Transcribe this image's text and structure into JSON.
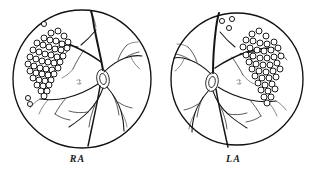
{
  "figure": {
    "kind": "retinal-fundus-line-drawing-pair",
    "background_color": "#ffffff",
    "ink_color": "#111111",
    "panels": [
      {
        "id": "right-eye",
        "label": "RA",
        "label_meaning": "right eye fundus",
        "limbus": {
          "cx": 82,
          "cy": 79,
          "r": 69
        },
        "optic_disc": {
          "cx": 103,
          "cy": 79,
          "rx": 6.5,
          "ry": 9.5,
          "rotate": -8
        },
        "macula": {
          "cx": 79,
          "cy": 82,
          "r": 3.4
        },
        "scar_cluster_count": 46,
        "scar_outlier_count": 2,
        "scar_radius": 3.0,
        "scar_region": "superior-nasal quadrant"
      },
      {
        "id": "left-eye",
        "label": "LA",
        "label_meaning": "left eye fundus",
        "limbus": {
          "cx": 81,
          "cy": 79,
          "r": 66
        },
        "optic_disc": {
          "cx": 56,
          "cy": 82,
          "rx": 6.5,
          "ry": 9.5,
          "rotate": 8
        },
        "macula": {
          "cx": 83,
          "cy": 82,
          "r": 3.4
        },
        "scar_cluster_count": 44,
        "scar_outlier_count": 3,
        "scar_radius": 3.0,
        "scar_region": "superior-temporal quadrant"
      }
    ]
  },
  "geometry": {
    "right_eye": {
      "limbus": {
        "cx": 82,
        "cy": 79,
        "r": 69
      },
      "disc": {
        "cx": 103,
        "cy": 79,
        "rx": 6.2,
        "ry": 9.6,
        "rot": -10
      },
      "macula_marks": [
        "M -2.5 -1.5 q 2 -1.6 4.2 0.2",
        "M -2.0 1.4 q 2.2 1.6 4.4 -0.3",
        "M 0.6 -2.6 l 0.3 5.0"
      ],
      "vessels": [
        {
          "w": "vessel-xl",
          "d": "M 103 70 C 101 58, 97 42, 94 26 C 93 19, 92 14, 91 11"
        },
        {
          "w": "vessel-lg",
          "d": "M 101 62 C 93 56, 82 50, 71 45 C 63 42, 55 40, 47 39"
        },
        {
          "w": "vessel-md",
          "d": "M 78 47 C 70 45, 62 45, 54 47"
        },
        {
          "w": "vessel-sm",
          "d": "M 71 45 C 68 51, 64 56, 59 60"
        },
        {
          "w": "vessel-sm",
          "d": "M 84 50 C 80 56, 76 62, 73 69"
        },
        {
          "w": "vessel-xs",
          "d": "M 73 69 C 70 73, 66 76, 62 78"
        },
        {
          "w": "vessel-md",
          "d": "M 104 72 C 110 66, 117 61, 125 58 C 131 56, 137 55, 142 56"
        },
        {
          "w": "vessel-sm",
          "d": "M 118 60 C 120 54, 123 49, 127 45"
        },
        {
          "w": "vessel-sm",
          "d": "M 125 58 C 129 55, 134 53, 139 52"
        },
        {
          "w": "vessel-xs",
          "d": "M 127 45 C 130 43, 134 42, 138 42"
        },
        {
          "w": "vessel-xs",
          "d": "M 131 57 C 133 62, 136 66, 140 69"
        },
        {
          "w": "vessel-md",
          "d": "M 103 88 C 100 97, 95 105, 88 112 C 82 118, 75 123, 69 127"
        },
        {
          "w": "vessel-sm",
          "d": "M 95 105 C 92 112, 90 119, 89 127"
        },
        {
          "w": "vessel-sm",
          "d": "M 88 112 C 82 113, 75 113, 69 111"
        },
        {
          "w": "vessel-lg",
          "d": "M 100 86 C 98 99, 95 113, 92 127 C 90 136, 89 142, 88 146"
        },
        {
          "w": "vessel-md",
          "d": "M 107 87 C 113 94, 118 102, 121 111 C 123 118, 124 125, 124 131"
        },
        {
          "w": "vessel-sm",
          "d": "M 113 95 C 116 101, 118 108, 119 115"
        },
        {
          "w": "vessel-sm",
          "d": "M 118 102 C 122 105, 127 107, 132 108"
        },
        {
          "w": "vessel-xs",
          "d": "M 121 111 C 124 116, 126 121, 127 127"
        },
        {
          "w": "vessel-md",
          "d": "M 98 84 C 89 90, 78 95, 66 98 C 57 100, 48 100, 40 99"
        },
        {
          "w": "vessel-sm",
          "d": "M 66 98 C 62 103, 58 108, 55 114"
        },
        {
          "w": "vessel-sm",
          "d": "M 55 114 C 59 117, 64 119, 70 120"
        },
        {
          "w": "vessel-xs",
          "d": "M 48 100 C 44 104, 41 109, 39 114"
        },
        {
          "w": "vessel-xs",
          "d": "M 40 99 C 36 101, 33 104, 30 108"
        },
        {
          "w": "vessel-sm",
          "d": "M 47 39 C 42 42, 37 46, 33 51"
        },
        {
          "w": "vessel-xs",
          "d": "M 54 47 C 51 52, 49 58, 48 64"
        },
        {
          "w": "vessel-md",
          "d": "M 96 30 C 91 36, 86 41, 81 45"
        },
        {
          "w": "vessel-xs",
          "d": "M 91 11 C 93 16, 95 21, 96 27"
        }
      ],
      "scars": [
        [
          51,
          33
        ],
        [
          58,
          31
        ],
        [
          64,
          36
        ],
        [
          44,
          38
        ],
        [
          50,
          40
        ],
        [
          56,
          41
        ],
        [
          62,
          44
        ],
        [
          68,
          42
        ],
        [
          37,
          43
        ],
        [
          43,
          45
        ],
        [
          49,
          47
        ],
        [
          55,
          49
        ],
        [
          61,
          50
        ],
        [
          67,
          48
        ],
        [
          33,
          50
        ],
        [
          39,
          52
        ],
        [
          45,
          54
        ],
        [
          51,
          55
        ],
        [
          57,
          57
        ],
        [
          63,
          56
        ],
        [
          30,
          57
        ],
        [
          36,
          59
        ],
        [
          42,
          61
        ],
        [
          48,
          62
        ],
        [
          54,
          63
        ],
        [
          60,
          62
        ],
        [
          28,
          64
        ],
        [
          34,
          66
        ],
        [
          40,
          68
        ],
        [
          46,
          69
        ],
        [
          52,
          70
        ],
        [
          58,
          68
        ],
        [
          30,
          71
        ],
        [
          36,
          73
        ],
        [
          42,
          74
        ],
        [
          48,
          75
        ],
        [
          54,
          74
        ],
        [
          33,
          78
        ],
        [
          39,
          80
        ],
        [
          45,
          81
        ],
        [
          51,
          80
        ],
        [
          37,
          85
        ],
        [
          43,
          86
        ],
        [
          49,
          85
        ],
        [
          41,
          91
        ],
        [
          47,
          91
        ],
        [
          44,
          96
        ]
      ],
      "scar_outliers": [
        [
          44,
          24
        ],
        [
          28,
          98
        ],
        [
          30,
          104
        ]
      ]
    },
    "left_eye": {
      "limbus": {
        "cx": 81,
        "cy": 79,
        "r": 66
      },
      "disc": {
        "cx": 56,
        "cy": 82,
        "rx": 6.2,
        "ry": 9.6,
        "rot": 10
      },
      "macula_marks": [
        "M -2.5 -1.5 q 2 -1.6 4.2 0.2",
        "M -2.0 1.4 q 2.2 1.6 4.4 -0.3",
        "M 0.6 -2.6 l 0.3 5.0"
      ],
      "vessels": [
        {
          "w": "vessel-xl",
          "d": "M 57 73 C 57 60, 58 44, 60 28 C 61 21, 62 16, 63 13"
        },
        {
          "w": "vessel-lg",
          "d": "M 59 68 C 68 62, 79 56, 91 52 C 100 49, 109 48, 117 48"
        },
        {
          "w": "vessel-md",
          "d": "M 84 54 C 93 52, 101 51, 109 52"
        },
        {
          "w": "vessel-sm",
          "d": "M 91 52 C 94 58, 97 63, 101 67"
        },
        {
          "w": "vessel-sm",
          "d": "M 76 57 C 80 63, 84 69, 87 75"
        },
        {
          "w": "vessel-xs",
          "d": "M 87 75 C 90 79, 94 82, 98 84"
        },
        {
          "w": "vessel-md",
          "d": "M 55 74 C 49 68, 42 63, 34 60 C 28 58, 22 57, 18 58"
        },
        {
          "w": "vessel-sm",
          "d": "M 41 62 C 39 56, 36 51, 32 47"
        },
        {
          "w": "vessel-sm",
          "d": "M 34 60 C 30 57, 25 55, 20 54"
        },
        {
          "w": "vessel-xs",
          "d": "M 32 47 C 29 45, 25 44, 21 44"
        },
        {
          "w": "vessel-xs",
          "d": "M 28 59 C 26 64, 23 68, 19 71"
        },
        {
          "w": "vessel-md",
          "d": "M 57 91 C 60 100, 65 108, 72 114 C 78 120, 85 124, 91 128"
        },
        {
          "w": "vessel-sm",
          "d": "M 65 108 C 68 114, 70 121, 71 129"
        },
        {
          "w": "vessel-sm",
          "d": "M 72 114 C 78 115, 85 115, 91 113"
        },
        {
          "w": "vessel-lg",
          "d": "M 60 89 C 62 102, 65 115, 68 129 C 70 138, 71 143, 72 147"
        },
        {
          "w": "vessel-md",
          "d": "M 53 90 C 47 97, 42 104, 39 113 C 37 120, 36 126, 36 132"
        },
        {
          "w": "vessel-sm",
          "d": "M 47 97 C 44 103, 42 110, 41 117"
        },
        {
          "w": "vessel-sm",
          "d": "M 42 104 C 38 107, 33 109, 28 110"
        },
        {
          "w": "vessel-xs",
          "d": "M 39 113 C 36 118, 34 123, 33 129"
        },
        {
          "w": "vessel-md",
          "d": "M 62 87 C 71 93, 82 97, 94 100 C 103 102, 112 102, 120 101"
        },
        {
          "w": "vessel-sm",
          "d": "M 94 100 C 98 105, 102 110, 105 116"
        },
        {
          "w": "vessel-sm",
          "d": "M 105 116 C 101 119, 96 121, 90 122"
        },
        {
          "w": "vessel-xs",
          "d": "M 112 102 C 116 106, 119 111, 121 116"
        },
        {
          "w": "vessel-xs",
          "d": "M 120 101 C 124 103, 127 106, 130 110"
        },
        {
          "w": "vessel-sm",
          "d": "M 117 48 C 122 51, 127 55, 131 60"
        },
        {
          "w": "vessel-xs",
          "d": "M 109 52 C 112 57, 114 63, 115 69"
        },
        {
          "w": "vessel-md",
          "d": "M 64 32 C 69 38, 74 43, 79 47"
        },
        {
          "w": "vessel-xs",
          "d": "M 63 13 C 62 18, 61 23, 60 29"
        }
      ],
      "scars": [
        [
          96,
          34
        ],
        [
          103,
          31
        ],
        [
          110,
          36
        ],
        [
          90,
          40
        ],
        [
          97,
          41
        ],
        [
          104,
          43
        ],
        [
          111,
          44
        ],
        [
          118,
          42
        ],
        [
          87,
          47
        ],
        [
          94,
          48
        ],
        [
          101,
          50
        ],
        [
          108,
          51
        ],
        [
          115,
          50
        ],
        [
          122,
          48
        ],
        [
          90,
          55
        ],
        [
          97,
          56
        ],
        [
          104,
          58
        ],
        [
          111,
          58
        ],
        [
          118,
          57
        ],
        [
          125,
          56
        ],
        [
          93,
          62
        ],
        [
          100,
          64
        ],
        [
          107,
          65
        ],
        [
          114,
          65
        ],
        [
          121,
          63
        ],
        [
          96,
          69
        ],
        [
          103,
          71
        ],
        [
          110,
          72
        ],
        [
          117,
          71
        ],
        [
          124,
          69
        ],
        [
          99,
          76
        ],
        [
          106,
          78
        ],
        [
          113,
          78
        ],
        [
          120,
          77
        ],
        [
          102,
          83
        ],
        [
          109,
          85
        ],
        [
          116,
          84
        ],
        [
          105,
          90
        ],
        [
          112,
          91
        ],
        [
          119,
          89
        ],
        [
          108,
          97
        ],
        [
          115,
          97
        ],
        [
          111,
          103
        ]
      ],
      "scar_outliers": [
        [
          66,
          21
        ],
        [
          76,
          19
        ],
        [
          73,
          28
        ]
      ]
    }
  }
}
